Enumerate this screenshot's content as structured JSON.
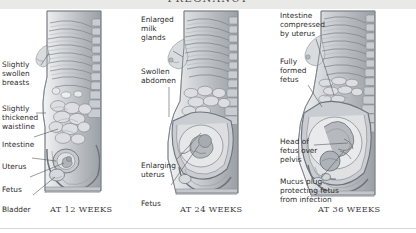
{
  "header": {
    "title": "PREGNANCY"
  },
  "panels": [
    {
      "id": "panel-12",
      "caption": "AT 12 WEEKS",
      "labels": [
        {
          "name": "slightly-swollen-breasts",
          "text": "Slightly\nswollen\nbreasts"
        },
        {
          "name": "slightly-thickened-waistline",
          "text": "Slightly\nthickened\nwaistline"
        },
        {
          "name": "intestine",
          "text": "Intestine"
        },
        {
          "name": "uterus",
          "text": "Uterus"
        },
        {
          "name": "fetus",
          "text": "Fetus"
        },
        {
          "name": "bladder",
          "text": "Bladder"
        }
      ]
    },
    {
      "id": "panel-24",
      "caption": "AT 24 WEEKS",
      "labels": [
        {
          "name": "enlarged-milk-glands",
          "text": "Enlarged\nmilk\nglands"
        },
        {
          "name": "swollen-abdomen",
          "text": "Swollen\nabdomen"
        },
        {
          "name": "enlarging-uterus",
          "text": "Enlarging\nuterus"
        },
        {
          "name": "fetus",
          "text": "Fetus"
        }
      ]
    },
    {
      "id": "panel-36",
      "caption": "AT 36 WEEKS",
      "labels": [
        {
          "name": "intestine-compressed-by-uterus",
          "text": "Intestine\ncompressed\nby uterus"
        },
        {
          "name": "fully-formed-fetus",
          "text": "Fully\nformed\nfetus"
        },
        {
          "name": "head-of-fetus-over-pelvis",
          "text": "Head of\nfetus over\npelvis"
        },
        {
          "name": "mucus-plug-protecting-fetus",
          "text": "Mucus plug\nprotecting fetus\nfrom infection"
        }
      ]
    }
  ],
  "colors": {
    "header_bar": "#e9e9e7",
    "header_text": "#4a4a4a",
    "label_text": "#2e2e2e",
    "leader_line": "#59595b",
    "illustration_mid": "#b9bcc0",
    "illustration_dark": "#7e838a",
    "illustration_light": "#e4e6e8",
    "page_background": "#ffffff",
    "rule": "#d6d6d4"
  }
}
